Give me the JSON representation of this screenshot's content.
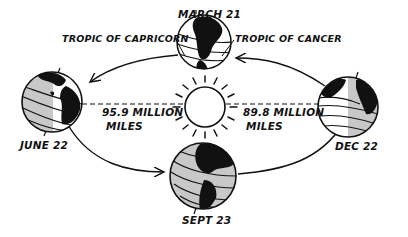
{
  "diagram": {
    "sun": {
      "label": ""
    },
    "positions": [
      {
        "id": "march",
        "label": "MARCH 21"
      },
      {
        "id": "june",
        "label": "JUNE 22"
      },
      {
        "id": "sept",
        "label": "SEPT 23"
      },
      {
        "id": "dec",
        "label": "DEC 22"
      }
    ],
    "tropics": {
      "capricorn": "TROPIC OF CAPRICORN",
      "cancer": "TROPIC OF CANCER"
    },
    "distances": {
      "june": {
        "line1": "95.9 MILLION",
        "line2": "MILES"
      },
      "dec": {
        "line1": "89.8 MILLION",
        "line2": "MILES"
      }
    },
    "colors": {
      "ink": "#111111",
      "land": "#111111",
      "night_shade": "#c8c8c8",
      "background": "#ffffff"
    }
  }
}
